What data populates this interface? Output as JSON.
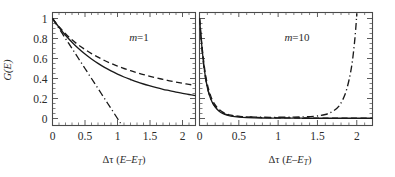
{
  "figure": {
    "background": "#ffffff",
    "ink": "#1a1a1a",
    "axis_color": "#4a4a4a"
  },
  "axes": {
    "y_label_main": "G",
    "y_label_paren_open": "(",
    "y_label_arg": "E",
    "y_label_paren_close": ")",
    "y_label_full": "G(E)",
    "x_label_full": "Δτ (E–E_T)",
    "x_label_delta": "Δτ (",
    "x_label_e1": "E",
    "x_label_dash": "–",
    "x_label_e2": "E",
    "x_label_sub": "T",
    "x_label_close": ")"
  },
  "panels": [
    {
      "id": "left",
      "annotation_m": "m",
      "annotation_eq": "=1",
      "annotation_full": "m=1",
      "show_y_axis": true,
      "x_tick_labels": [
        "0",
        "0.5",
        "1",
        "1.5",
        "2"
      ],
      "y_tick_labels": [
        "0",
        "0.2",
        "0.4",
        "0.6",
        "0.8",
        "1"
      ]
    },
    {
      "id": "right",
      "annotation_m": "m",
      "annotation_eq": "=10",
      "annotation_full": "m=10",
      "show_y_axis": false,
      "x_tick_labels": [
        "0",
        "0.5",
        "1",
        "1.5",
        "2"
      ],
      "y_tick_labels": []
    }
  ],
  "chart_data": {
    "type": "line",
    "title": "",
    "xlabel": "Δτ (E–E_T)",
    "ylabel": "G(E)",
    "xlim": [
      0,
      2.2
    ],
    "ylim": [
      -0.07,
      1.06
    ],
    "grid": false,
    "legend": "none",
    "x_ticks": [
      0,
      0.5,
      1,
      1.5,
      2
    ],
    "x_minor_tick_step": 0.1,
    "y_ticks": [
      0,
      0.2,
      0.4,
      0.6,
      0.8,
      1
    ],
    "y_minor_tick_step": 0.05,
    "subplots": [
      {
        "name": "m=1",
        "annotation": "m=1",
        "series": [
          {
            "name": "solid",
            "style": "solid",
            "x": [
              0,
              0.1,
              0.2,
              0.3,
              0.4,
              0.5,
              0.6,
              0.7,
              0.8,
              0.9,
              1.0,
              1.1,
              1.2,
              1.3,
              1.4,
              1.5,
              1.6,
              1.7,
              1.8,
              1.9,
              2.0,
              2.1,
              2.2
            ],
            "y": [
              1.0,
              0.912,
              0.833,
              0.763,
              0.7,
              0.645,
              0.595,
              0.551,
              0.511,
              0.476,
              0.444,
              0.415,
              0.39,
              0.366,
              0.345,
              0.326,
              0.308,
              0.292,
              0.278,
              0.264,
              0.252,
              0.24,
              0.229
            ]
          },
          {
            "name": "dashed",
            "style": "dashed",
            "x": [
              0,
              0.1,
              0.2,
              0.3,
              0.4,
              0.5,
              0.6,
              0.7,
              0.8,
              0.9,
              1.0,
              1.1,
              1.2,
              1.3,
              1.4,
              1.5,
              1.6,
              1.7,
              1.8,
              1.9,
              2.0,
              2.1,
              2.2
            ],
            "y": [
              1.0,
              0.917,
              0.847,
              0.787,
              0.735,
              0.69,
              0.649,
              0.613,
              0.58,
              0.551,
              0.524,
              0.5,
              0.478,
              0.458,
              0.439,
              0.422,
              0.406,
              0.391,
              0.377,
              0.364,
              0.352,
              0.341,
              0.33
            ]
          },
          {
            "name": "dash-dot",
            "style": "dash-dot",
            "x": [
              0,
              0.1,
              0.2,
              0.3,
              0.4,
              0.5,
              0.6,
              0.7,
              0.8,
              0.9,
              1.0,
              1.05
            ],
            "y": [
              1.0,
              0.9,
              0.8,
              0.7,
              0.6,
              0.5,
              0.4,
              0.3,
              0.2,
              0.1,
              0.0,
              -0.05
            ]
          }
        ]
      },
      {
        "name": "m=10",
        "annotation": "m=10",
        "series": [
          {
            "name": "solid",
            "style": "solid",
            "x": [
              0,
              0.03,
              0.06,
              0.09,
              0.12,
              0.16,
              0.2,
              0.25,
              0.3,
              0.35,
              0.4,
              0.5,
              0.6,
              0.8,
              1.0,
              1.3,
              1.6,
              1.9,
              2.2
            ],
            "y": [
              1.0,
              0.72,
              0.5,
              0.35,
              0.25,
              0.165,
              0.115,
              0.073,
              0.048,
              0.033,
              0.024,
              0.014,
              0.009,
              0.005,
              0.004,
              0.003,
              0.003,
              0.003,
              0.003
            ]
          },
          {
            "name": "dashed",
            "style": "dashed",
            "x": [
              0,
              0.03,
              0.06,
              0.09,
              0.12,
              0.16,
              0.2,
              0.25,
              0.3,
              0.35,
              0.4,
              0.5,
              0.6,
              0.8,
              1.0,
              1.3,
              1.6,
              1.9,
              2.2
            ],
            "y": [
              1.0,
              0.74,
              0.53,
              0.38,
              0.28,
              0.19,
              0.135,
              0.09,
              0.062,
              0.045,
              0.034,
              0.021,
              0.015,
              0.009,
              0.007,
              0.005,
              0.004,
              0.004,
              0.004
            ]
          },
          {
            "name": "dash-dot",
            "style": "dash-dot",
            "x": [
              0,
              0.03,
              0.06,
              0.1,
              0.15,
              0.2,
              0.3,
              0.4,
              0.6,
              0.9,
              1.2,
              1.45,
              1.6,
              1.7,
              1.78,
              1.85,
              1.9,
              1.94,
              1.97,
              1.99,
              2.0
            ],
            "y": [
              1.0,
              0.71,
              0.49,
              0.31,
              0.185,
              0.12,
              0.055,
              0.03,
              0.016,
              0.012,
              0.014,
              0.022,
              0.04,
              0.075,
              0.13,
              0.24,
              0.38,
              0.55,
              0.75,
              0.93,
              1.05
            ]
          }
        ]
      }
    ]
  }
}
